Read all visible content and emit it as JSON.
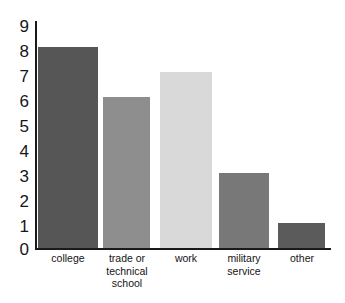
{
  "chart_data": {
    "type": "bar",
    "title": "",
    "subtitle": "",
    "xlabel": "",
    "ylabel": "",
    "categories": [
      "college",
      "trade or technical school",
      "work",
      "military service",
      "other"
    ],
    "category_lines": [
      [
        "college"
      ],
      [
        "trade or",
        "technical",
        "school"
      ],
      [
        "work"
      ],
      [
        "military",
        "service"
      ],
      [
        "other"
      ]
    ],
    "values": [
      8,
      6,
      7,
      3,
      1
    ],
    "ylim": [
      0,
      9
    ],
    "ytick_labels": [
      "9",
      "8",
      "7",
      "6",
      "5",
      "4",
      "3",
      "2",
      "1",
      "0"
    ],
    "ytick_values": [
      9,
      8,
      7,
      6,
      5,
      4,
      3,
      2,
      1,
      0
    ],
    "grid": false,
    "legend": "none",
    "bar_colors": [
      "#565656",
      "#8e8e8e",
      "#d9d9d9",
      "#787878",
      "#5b5b5b"
    ],
    "axis_color": "#1a1a1a",
    "background_color": "#ffffff"
  }
}
